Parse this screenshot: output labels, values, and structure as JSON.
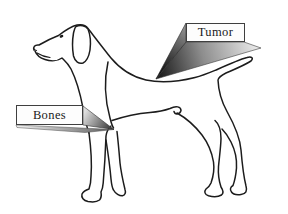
{
  "figure": {
    "alt": "Outline line drawing of a standing pointer dog facing left, with two three-dimensional callout labels pointing at body regions",
    "labels": {
      "tumor": "Tumor",
      "bones": "Bones"
    },
    "pointers": {
      "tumor_target": "withers / shoulder area of the back",
      "bones_target": "front leg elbow area"
    },
    "colors": {
      "background": "#ffffff",
      "line": "#1c1c1c",
      "label_background": "#fdfdfd",
      "label_border": "#3f3f3f",
      "pointer_dark": "#141414",
      "pointer_light": "#ebebeb"
    }
  }
}
